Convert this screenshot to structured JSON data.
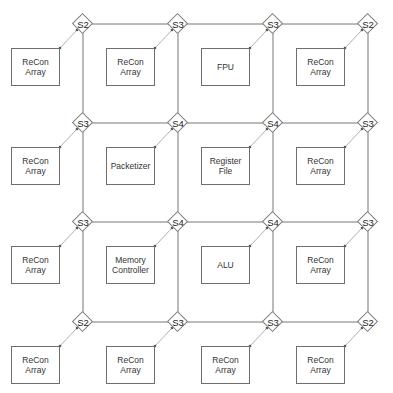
{
  "diagram": {
    "type": "mesh-network-on-chip",
    "grid": {
      "cols": 4,
      "rows": 4
    },
    "switches": [
      [
        "S2",
        "S3",
        "S3",
        "S2"
      ],
      [
        "S3",
        "S4",
        "S4",
        "S3"
      ],
      [
        "S3",
        "S4",
        "S4",
        "S3"
      ],
      [
        "S2",
        "S3",
        "S3",
        "S2"
      ]
    ],
    "nodes": [
      [
        "ReCon\nArray",
        "ReCon\nArray",
        "FPU",
        "ReCon\nArray"
      ],
      [
        "ReCon\nArray",
        "Packetizer",
        "Register\nFile",
        "ReCon\nArray"
      ],
      [
        "ReCon\nArray",
        "Memory\nController",
        "ALU",
        "ReCon\nArray"
      ],
      [
        "ReCon\nArray",
        "ReCon\nArray",
        "ReCon\nArray",
        "ReCon\nArray"
      ]
    ],
    "colors": {
      "line": "#777777",
      "link": "#b0b0b0",
      "text": "#333333"
    }
  }
}
